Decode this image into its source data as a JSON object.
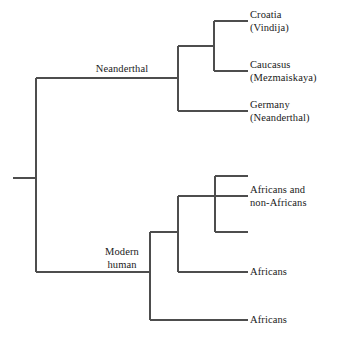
{
  "figure": {
    "kind": "phylogenetic-cladogram",
    "title": "",
    "background_color": "#ffffff",
    "line_color": "#4d4d4d",
    "text_color": "#1a1a1a",
    "line_width": 1.15
  },
  "tips": [
    {
      "id": "croatia",
      "lines": [
        "Croatia",
        "(Vindija)"
      ],
      "text": "Croatia\n(Vindija)",
      "label_x": 250,
      "label_y": 9,
      "tip_x": 248,
      "tip_y": 21
    },
    {
      "id": "caucasus",
      "lines": [
        "Caucasus",
        "(Mezmaiskaya)"
      ],
      "text": "Caucasus\n(Mezmaiskaya)",
      "label_x": 250,
      "label_y": 59,
      "tip_x": 248,
      "tip_y": 71
    },
    {
      "id": "germany",
      "lines": [
        "Germany",
        "(Neanderthal)"
      ],
      "text": "Germany\n(Neanderthal)",
      "label_x": 250,
      "label_y": 99,
      "tip_x": 248,
      "tip_y": 111
    },
    {
      "id": "africans-and-non-africans",
      "lines": [
        "Africans and",
        "non-Africans"
      ],
      "text": "Africans and\nnon-Africans",
      "label_x": 250,
      "label_y": 184,
      "tip_x": 248,
      "tip_y": 196
    },
    {
      "id": "africans-upper",
      "lines": [
        "Africans"
      ],
      "text": "Africans",
      "label_x": 250,
      "label_y": 266,
      "tip_x": 248,
      "tip_y": 272
    },
    {
      "id": "africans-lower",
      "lines": [
        "Africans"
      ],
      "text": "Africans",
      "label_x": 250,
      "label_y": 314,
      "tip_x": 248,
      "tip_y": 320
    }
  ],
  "internal_labels": [
    {
      "id": "neanderthal",
      "lines": [
        "Neanderthal"
      ],
      "text": "Neanderthal",
      "label_x": 64,
      "label_y": 63,
      "width": 116
    },
    {
      "id": "modern-human",
      "lines": [
        "Modern",
        "human"
      ],
      "text": "Modern\nhuman",
      "label_x": 72,
      "label_y": 246,
      "width": 100
    }
  ],
  "branches": [
    {
      "id": "root-stub",
      "x1": 13,
      "y1": 178,
      "x2": 36,
      "y2": 178
    },
    {
      "id": "root-vertical",
      "x1": 36,
      "y1": 78,
      "x2": 36,
      "y2": 272
    },
    {
      "id": "neanderthal-stem",
      "x1": 36,
      "y1": 78,
      "x2": 178,
      "y2": 78
    },
    {
      "id": "neanderthal-vertical",
      "x1": 178,
      "y1": 46,
      "x2": 178,
      "y2": 111
    },
    {
      "id": "vindija-caucasus-stem",
      "x1": 178,
      "y1": 46,
      "x2": 214,
      "y2": 46
    },
    {
      "id": "vindija-caucasus-vert",
      "x1": 214,
      "y1": 21,
      "x2": 214,
      "y2": 71
    },
    {
      "id": "croatia-tip-line",
      "x1": 214,
      "y1": 21,
      "x2": 248,
      "y2": 21
    },
    {
      "id": "caucasus-tip-line",
      "x1": 214,
      "y1": 71,
      "x2": 248,
      "y2": 71
    },
    {
      "id": "germany-tip-line",
      "x1": 178,
      "y1": 111,
      "x2": 248,
      "y2": 111
    },
    {
      "id": "modern-human-stem",
      "x1": 36,
      "y1": 272,
      "x2": 150,
      "y2": 272
    },
    {
      "id": "modern-human-vertical",
      "x1": 150,
      "y1": 232,
      "x2": 150,
      "y2": 320
    },
    {
      "id": "africans-lower-tip",
      "x1": 150,
      "y1": 320,
      "x2": 248,
      "y2": 320
    },
    {
      "id": "modern-clade-stem",
      "x1": 150,
      "y1": 232,
      "x2": 178,
      "y2": 232
    },
    {
      "id": "modern-clade-vertical",
      "x1": 178,
      "y1": 196,
      "x2": 178,
      "y2": 272
    },
    {
      "id": "africans-upper-tip",
      "x1": 178,
      "y1": 272,
      "x2": 248,
      "y2": 272
    },
    {
      "id": "mixed-clade-stem",
      "x1": 178,
      "y1": 196,
      "x2": 248,
      "y2": 196
    },
    {
      "id": "mixed-clade-vertical",
      "x1": 215,
      "y1": 176,
      "x2": 215,
      "y2": 232
    },
    {
      "id": "mixed-top-tip",
      "x1": 215,
      "y1": 176,
      "x2": 248,
      "y2": 176
    },
    {
      "id": "mixed-bottom-tip",
      "x1": 215,
      "y1": 232,
      "x2": 248,
      "y2": 232
    }
  ]
}
